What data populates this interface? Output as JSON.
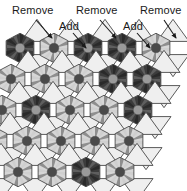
{
  "figure": {
    "type": "diagram",
    "title": "",
    "background_color": "#ffffff",
    "outline_color": "#3a3a3a",
    "width": 187,
    "height": 191
  },
  "annotations": [
    {
      "id": "remove-1",
      "label": "Remove",
      "text_x": 12,
      "text_y": 14,
      "arrow_from_x": 36,
      "arrow_from_y": 20,
      "arrow_to_x": 52,
      "arrow_to_y": 38
    },
    {
      "id": "add-1",
      "label": "Add",
      "text_x": 59,
      "text_y": 30,
      "arrow_from_x": 73,
      "arrow_from_y": 33,
      "arrow_to_x": 86,
      "arrow_to_y": 48
    },
    {
      "id": "remove-2",
      "label": "Remove",
      "text_x": 76,
      "text_y": 14,
      "arrow_from_x": 100,
      "arrow_from_y": 20,
      "arrow_to_x": 116,
      "arrow_to_y": 38
    },
    {
      "id": "add-2",
      "label": "Add",
      "text_x": 123,
      "text_y": 30,
      "arrow_from_x": 137,
      "arrow_from_y": 33,
      "arrow_to_x": 150,
      "arrow_to_y": 48
    },
    {
      "id": "remove-3",
      "label": "Remove",
      "text_x": 140,
      "text_y": 14,
      "arrow_from_x": 164,
      "arrow_from_y": 20,
      "arrow_to_x": 176,
      "arrow_to_y": 38
    }
  ],
  "palette": {
    "hex_dark_fill": "#3c3c3c",
    "hex_dark_wedge_a": "#2a2a2a",
    "hex_dark_wedge_b": "#5e5e5e",
    "hex_dark_center": "#9a9a9a",
    "hex_light_fill": "#d6d6d6",
    "hex_light_wedge_a": "#8e8e8e",
    "hex_light_wedge_b": "#cfcfcf",
    "hex_light_center": "#4a4a4a",
    "triangle_fill": "#efefef",
    "stroke": "#4a4a4a",
    "label_color": "#1a1a1a"
  },
  "tiling": {
    "motif_spokes": 12,
    "hex_radius": 16,
    "column_dx": 34,
    "row_dy": 31,
    "column_skew_dx": -9,
    "columns": 5,
    "rows": 5,
    "cells": [
      {
        "col": 0,
        "row": 0,
        "tone": "dark"
      },
      {
        "col": 0,
        "row": 1,
        "tone": "light"
      },
      {
        "col": 0,
        "row": 2,
        "tone": "light"
      },
      {
        "col": 0,
        "row": 3,
        "tone": "light"
      },
      {
        "col": 0,
        "row": 4,
        "tone": "dark"
      },
      {
        "col": 1,
        "row": 0,
        "tone": "light"
      },
      {
        "col": 1,
        "row": 1,
        "tone": "light"
      },
      {
        "col": 1,
        "row": 2,
        "tone": "dark"
      },
      {
        "col": 1,
        "row": 3,
        "tone": "light"
      },
      {
        "col": 1,
        "row": 4,
        "tone": "light"
      },
      {
        "col": 2,
        "row": 0,
        "tone": "dark"
      },
      {
        "col": 2,
        "row": 1,
        "tone": "light"
      },
      {
        "col": 2,
        "row": 2,
        "tone": "light"
      },
      {
        "col": 2,
        "row": 3,
        "tone": "light"
      },
      {
        "col": 2,
        "row": 4,
        "tone": "light"
      },
      {
        "col": 3,
        "row": 0,
        "tone": "dark"
      },
      {
        "col": 3,
        "row": 1,
        "tone": "dark"
      },
      {
        "col": 3,
        "row": 2,
        "tone": "light"
      },
      {
        "col": 3,
        "row": 3,
        "tone": "light"
      },
      {
        "col": 3,
        "row": 4,
        "tone": "dark"
      },
      {
        "col": 4,
        "row": 0,
        "tone": "light"
      },
      {
        "col": 4,
        "row": 1,
        "tone": "dark"
      },
      {
        "col": 4,
        "row": 2,
        "tone": "dark"
      },
      {
        "col": 4,
        "row": 3,
        "tone": "light"
      },
      {
        "col": 4,
        "row": 4,
        "tone": "light"
      }
    ]
  }
}
